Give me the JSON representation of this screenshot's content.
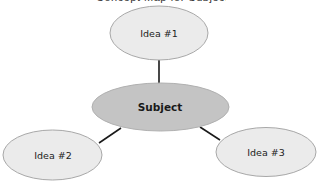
{
  "diagram": {
    "type": "mind-map",
    "clipped_title": "Concept Map for Subject",
    "colors": {
      "idea_fill": "#ebebeb",
      "idea_stroke": "#a8a8a8",
      "subject_fill": "#c4c4c4",
      "subject_stroke": "#b0b0b0",
      "connector": "#1a1a1a"
    },
    "center": {
      "label": "Subject"
    },
    "ideas": [
      {
        "label": "Idea #1"
      },
      {
        "label": "Idea #2"
      },
      {
        "label": "Idea #3"
      }
    ],
    "edges": [
      {
        "from": "Subject",
        "to": "Idea #1"
      },
      {
        "from": "Subject",
        "to": "Idea #2"
      },
      {
        "from": "Subject",
        "to": "Idea #3"
      }
    ]
  }
}
